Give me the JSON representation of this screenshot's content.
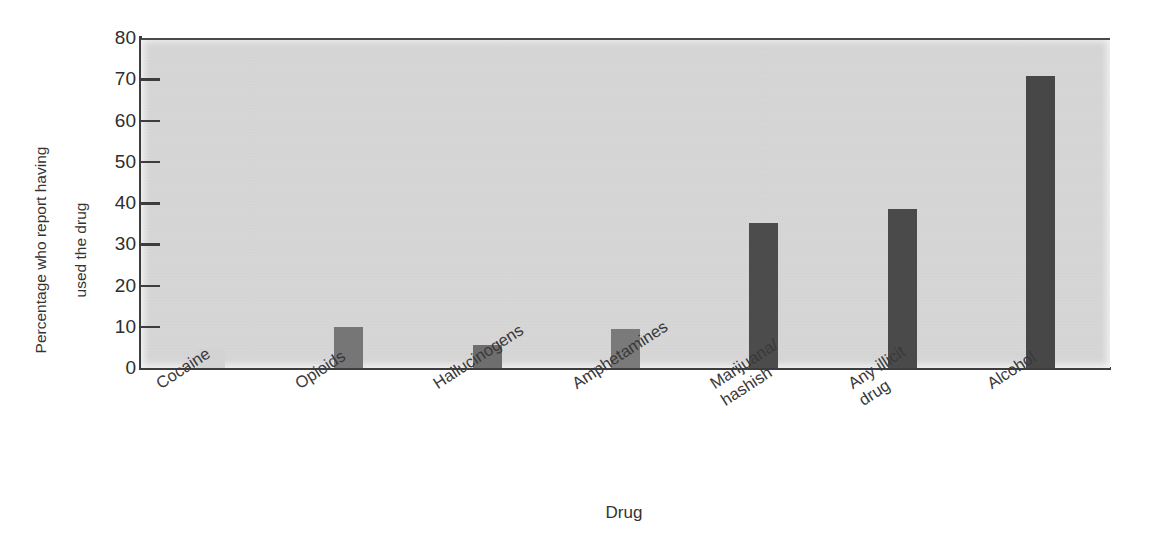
{
  "chart_data": {
    "type": "bar",
    "title": "",
    "xlabel": "Drug",
    "ylabel": "Percentage who report having used the drug",
    "ylabel_lines": [
      "Percentage who report having",
      "used the drug"
    ],
    "categories": [
      "Cocaine",
      "Opioids",
      "Hallucinogens",
      "Amphetamines",
      "Marijuana/\nhashish",
      "Any illicit\ndrug",
      "Alcohol"
    ],
    "category_lines": [
      [
        "Cocaine"
      ],
      [
        "Opioids"
      ],
      [
        "Hallucinogens"
      ],
      [
        "Amphetamines"
      ],
      [
        "Marijuana/",
        "hashish"
      ],
      [
        "Any illicit",
        "drug"
      ],
      [
        "Alcohol"
      ]
    ],
    "values": [
      4.5,
      10,
      5.5,
      9.5,
      35.2,
      38.5,
      70.8
    ],
    "bar_colors": [
      "#d3d3d3",
      "#767676",
      "#6e6e6e",
      "#7a7a7a",
      "#4c4c4c",
      "#4a4a4a",
      "#474747"
    ],
    "ylim": [
      0,
      80
    ],
    "yticks": [
      80,
      70,
      60,
      50,
      40,
      30,
      20,
      10,
      0
    ],
    "ytick_labels": [
      "80",
      "70",
      "60",
      "50",
      "40",
      "30",
      "20",
      "10",
      "0"
    ],
    "grid": false,
    "legend": null,
    "plot_background": "#d9d9d9",
    "axis_color": "#3d3d3d"
  }
}
